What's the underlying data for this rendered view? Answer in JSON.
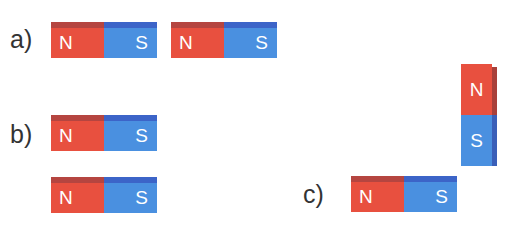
{
  "figure": {
    "colors": {
      "north": "#e8503f",
      "south": "#4a90e0"
    },
    "groups": [
      {
        "label": "a)",
        "magnets": [
          {
            "orientation": "horizontal",
            "poles": [
              "N",
              "S"
            ]
          },
          {
            "orientation": "horizontal",
            "poles": [
              "N",
              "S"
            ]
          }
        ]
      },
      {
        "label": "b)",
        "magnets": [
          {
            "orientation": "horizontal",
            "poles": [
              "N",
              "S"
            ]
          },
          {
            "orientation": "horizontal",
            "poles": [
              "N",
              "S"
            ]
          }
        ]
      },
      {
        "label": "c)",
        "magnets": [
          {
            "orientation": "horizontal",
            "poles": [
              "N",
              "S"
            ]
          },
          {
            "orientation": "vertical",
            "poles": [
              "N",
              "S"
            ]
          }
        ]
      }
    ]
  }
}
